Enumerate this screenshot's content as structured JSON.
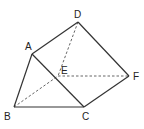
{
  "diagram": {
    "type": "triangular-prism",
    "vertices": [
      {
        "id": "A",
        "label": "A",
        "x": 32,
        "y": 54,
        "lx": 25,
        "ly": 50
      },
      {
        "id": "B",
        "label": "B",
        "x": 14,
        "y": 107,
        "lx": 4,
        "ly": 120
      },
      {
        "id": "C",
        "label": "C",
        "x": 84,
        "y": 107,
        "lx": 82,
        "ly": 120
      },
      {
        "id": "D",
        "label": "D",
        "x": 78,
        "y": 22,
        "lx": 74,
        "ly": 18
      },
      {
        "id": "E",
        "label": "E",
        "x": 58,
        "y": 76,
        "lx": 61,
        "ly": 74
      },
      {
        "id": "F",
        "label": "F",
        "x": 129,
        "y": 76,
        "lx": 133,
        "ly": 80
      }
    ],
    "solid_edges": [
      [
        "A",
        "D"
      ],
      [
        "D",
        "F"
      ],
      [
        "A",
        "B"
      ],
      [
        "A",
        "C"
      ],
      [
        "B",
        "C"
      ],
      [
        "C",
        "F"
      ]
    ],
    "dashed_edges": [
      [
        "D",
        "E"
      ],
      [
        "B",
        "E"
      ],
      [
        "E",
        "F"
      ]
    ]
  }
}
